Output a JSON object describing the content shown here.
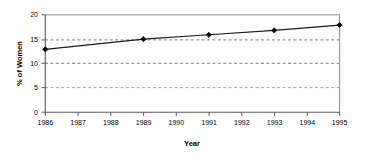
{
  "chart_data": {
    "type": "line",
    "title": "",
    "xlabel": "Year",
    "ylabel": "% of Women",
    "x": [
      1986,
      1989,
      1991,
      1993,
      1995
    ],
    "values": [
      12.9,
      15.0,
      15.9,
      16.8,
      17.9
    ],
    "series": [
      {
        "name": "% of Women",
        "values": [
          12.9,
          15.0,
          15.9,
          16.8,
          17.9
        ]
      }
    ],
    "xlim": [
      1986,
      1995
    ],
    "ylim": [
      0,
      20
    ],
    "x_tick_labels": [
      "1986",
      "1987",
      "1988",
      "1989",
      "1990",
      "1991",
      "1992",
      "1993",
      "1994",
      "1995"
    ],
    "x_ticks": [
      1986,
      1987,
      1988,
      1989,
      1990,
      1991,
      1992,
      1993,
      1994,
      1995
    ],
    "y_tick_labels": [
      "0",
      "5",
      "10",
      "15",
      "20"
    ],
    "y_ticks": [
      0,
      5,
      10,
      15,
      20
    ],
    "grid": "horizontal-dashed",
    "legend": "none",
    "marker": "filled-diamond",
    "line_color": "#000000",
    "marker_color": "#000000",
    "grid_color": "#808080",
    "axis_color": "#808080",
    "background_color": "#ffffff"
  },
  "axes": {
    "y_title": "% of Women",
    "x_title": "Year"
  },
  "y_labels": {
    "t0": "0",
    "t1": "5",
    "t2": "10",
    "t3": "15",
    "t4": "20"
  },
  "x_labels": {
    "t0": "1986",
    "t1": "1987",
    "t2": "1988",
    "t3": "1989",
    "t4": "1990",
    "t5": "1991",
    "t6": "1992",
    "t7": "1993",
    "t8": "1994",
    "t9": "1995"
  }
}
